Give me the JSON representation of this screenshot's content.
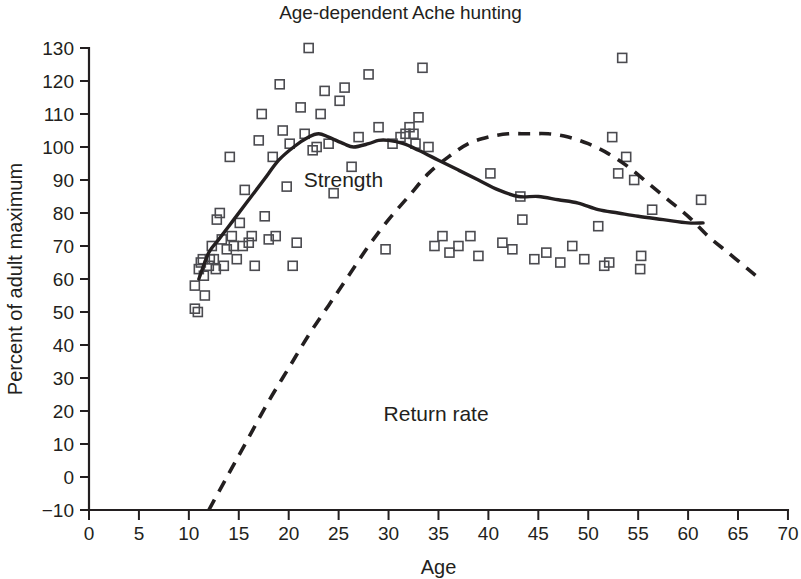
{
  "chart_data": {
    "type": "scatter",
    "title": "Age-dependent Ache hunting",
    "xlabel": "Age",
    "ylabel": "Percent of adult maximum",
    "xlim": [
      0,
      70
    ],
    "ylim": [
      -10,
      130
    ],
    "grid": false,
    "legend_position": "inline-annotations",
    "xticks": [
      0,
      5,
      10,
      15,
      20,
      25,
      30,
      35,
      40,
      45,
      50,
      55,
      60,
      65,
      70
    ],
    "yticks": [
      -10,
      0,
      10,
      20,
      30,
      40,
      50,
      60,
      70,
      80,
      90,
      100,
      110,
      120,
      130
    ],
    "xtick_labels": [
      "0",
      "5",
      "10",
      "15",
      "20",
      "25",
      "30",
      "35",
      "40",
      "45",
      "50",
      "55",
      "60",
      "65",
      "70"
    ],
    "ytick_labels": [
      "−10",
      "0",
      "10",
      "20",
      "30",
      "40",
      "50",
      "60",
      "70",
      "80",
      "90",
      "100",
      "110",
      "120",
      "130"
    ],
    "annotations": [
      {
        "text": "Strength",
        "x": 21.5,
        "y": 88
      },
      {
        "text": "Return rate",
        "x": 29.5,
        "y": 17
      }
    ],
    "scatter": {
      "name": "Strength observations",
      "marker": "open-square",
      "points": [
        [
          10.6,
          58
        ],
        [
          10.6,
          51
        ],
        [
          10.9,
          50
        ],
        [
          11.0,
          63
        ],
        [
          11.2,
          65
        ],
        [
          11.4,
          66
        ],
        [
          11.5,
          61
        ],
        [
          11.6,
          55
        ],
        [
          12.0,
          64
        ],
        [
          12.1,
          66
        ],
        [
          12.3,
          70
        ],
        [
          12.5,
          66
        ],
        [
          12.7,
          63
        ],
        [
          12.8,
          78
        ],
        [
          13.1,
          80
        ],
        [
          13.3,
          72
        ],
        [
          13.5,
          64
        ],
        [
          13.8,
          69
        ],
        [
          14.1,
          97
        ],
        [
          14.3,
          73
        ],
        [
          14.5,
          70
        ],
        [
          14.8,
          66
        ],
        [
          15.1,
          77
        ],
        [
          15.4,
          70
        ],
        [
          15.6,
          87
        ],
        [
          16.0,
          71
        ],
        [
          16.3,
          73
        ],
        [
          16.6,
          64
        ],
        [
          17.0,
          102
        ],
        [
          17.3,
          110
        ],
        [
          17.6,
          79
        ],
        [
          18.0,
          72
        ],
        [
          18.4,
          97
        ],
        [
          18.7,
          73
        ],
        [
          19.1,
          119
        ],
        [
          19.4,
          105
        ],
        [
          19.8,
          88
        ],
        [
          20.1,
          101
        ],
        [
          20.4,
          64
        ],
        [
          20.8,
          71
        ],
        [
          21.2,
          112
        ],
        [
          21.6,
          104
        ],
        [
          22.0,
          130
        ],
        [
          22.4,
          99
        ],
        [
          22.8,
          100
        ],
        [
          23.2,
          110
        ],
        [
          23.6,
          117
        ],
        [
          24.0,
          101
        ],
        [
          24.5,
          86
        ],
        [
          25.1,
          114
        ],
        [
          25.6,
          118
        ],
        [
          26.3,
          94
        ],
        [
          27.0,
          103
        ],
        [
          28.0,
          122
        ],
        [
          29.0,
          106
        ],
        [
          29.7,
          69
        ],
        [
          30.4,
          101
        ],
        [
          31.2,
          103
        ],
        [
          31.7,
          104
        ],
        [
          32.1,
          106
        ],
        [
          32.5,
          104
        ],
        [
          32.7,
          101
        ],
        [
          33.0,
          109
        ],
        [
          33.4,
          124
        ],
        [
          34.0,
          100
        ],
        [
          34.6,
          70
        ],
        [
          35.4,
          73
        ],
        [
          36.1,
          68
        ],
        [
          37.0,
          70
        ],
        [
          38.2,
          73
        ],
        [
          39.0,
          67
        ],
        [
          40.2,
          92
        ],
        [
          41.4,
          71
        ],
        [
          42.4,
          69
        ],
        [
          43.2,
          85
        ],
        [
          43.4,
          78
        ],
        [
          44.6,
          66
        ],
        [
          45.8,
          68
        ],
        [
          47.2,
          65
        ],
        [
          48.4,
          70
        ],
        [
          49.6,
          66
        ],
        [
          51.0,
          76
        ],
        [
          51.6,
          64
        ],
        [
          52.1,
          65
        ],
        [
          52.4,
          103
        ],
        [
          53.0,
          92
        ],
        [
          53.4,
          127
        ],
        [
          53.8,
          97
        ],
        [
          54.6,
          90
        ],
        [
          55.2,
          63
        ],
        [
          55.3,
          67
        ],
        [
          56.4,
          81
        ],
        [
          61.3,
          84
        ]
      ]
    },
    "curves": [
      {
        "name": "Strength",
        "style": "solid",
        "points": [
          [
            11.0,
            60
          ],
          [
            12.0,
            68
          ],
          [
            13.0,
            72
          ],
          [
            14.5,
            78
          ],
          [
            16.0,
            84
          ],
          [
            17.5,
            90
          ],
          [
            19.0,
            96
          ],
          [
            20.5,
            100
          ],
          [
            22.0,
            103
          ],
          [
            23.0,
            104
          ],
          [
            24.0,
            103
          ],
          [
            25.5,
            101
          ],
          [
            26.5,
            100
          ],
          [
            28.0,
            101
          ],
          [
            29.0,
            102
          ],
          [
            30.0,
            102
          ],
          [
            31.5,
            101
          ],
          [
            33.0,
            99
          ],
          [
            35.0,
            96
          ],
          [
            37.0,
            93
          ],
          [
            39.0,
            90
          ],
          [
            41.0,
            87
          ],
          [
            43.0,
            85
          ],
          [
            45.0,
            85
          ],
          [
            47.0,
            84
          ],
          [
            49.0,
            83
          ],
          [
            51.0,
            81
          ],
          [
            53.0,
            80
          ],
          [
            55.0,
            79
          ],
          [
            57.5,
            78
          ],
          [
            60.0,
            77
          ],
          [
            61.5,
            77
          ]
        ]
      },
      {
        "name": "Return rate",
        "style": "dashed",
        "points": [
          [
            12.0,
            -10
          ],
          [
            14.0,
            1
          ],
          [
            16.0,
            12
          ],
          [
            18.0,
            23
          ],
          [
            20.0,
            33
          ],
          [
            22.0,
            43
          ],
          [
            24.0,
            52
          ],
          [
            26.0,
            61
          ],
          [
            28.0,
            70
          ],
          [
            30.0,
            78
          ],
          [
            32.0,
            85
          ],
          [
            34.0,
            92
          ],
          [
            36.0,
            97
          ],
          [
            38.0,
            101
          ],
          [
            40.0,
            103
          ],
          [
            42.0,
            104
          ],
          [
            44.0,
            104
          ],
          [
            46.0,
            104
          ],
          [
            48.0,
            103
          ],
          [
            50.0,
            101
          ],
          [
            52.0,
            98
          ],
          [
            54.0,
            94
          ],
          [
            56.0,
            89
          ],
          [
            58.0,
            84
          ],
          [
            60.0,
            79
          ],
          [
            62.0,
            73
          ],
          [
            64.0,
            68
          ],
          [
            66.0,
            63
          ],
          [
            67.2,
            60
          ]
        ]
      }
    ]
  }
}
